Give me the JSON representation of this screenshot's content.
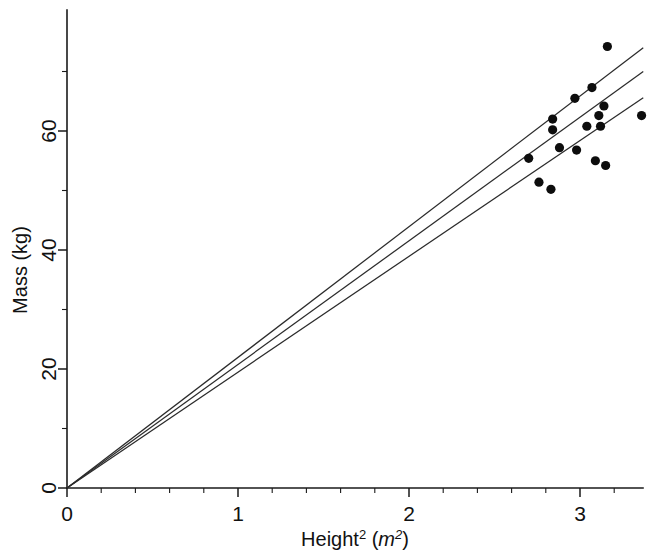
{
  "chart_data": {
    "type": "scatter",
    "title": "",
    "subtitle": "",
    "xlabel": "Height² (m²)",
    "xlabel_parts": {
      "base": "Height",
      "base_exponent": "2",
      "unit_open": " (",
      "unit": "m",
      "unit_exponent": "2",
      "unit_close": ")"
    },
    "ylabel": "Mass (kg)",
    "xlim": [
      0,
      3.37
    ],
    "ylim": [
      0,
      76
    ],
    "grid": false,
    "legend": null,
    "x_ticks_major": [
      0,
      1,
      2,
      3
    ],
    "x_tick_labels": [
      "0",
      "1",
      "2",
      "3"
    ],
    "x_ticks_minor": [
      0.2,
      0.4,
      0.6,
      0.8,
      1.2,
      1.4,
      1.6,
      1.8,
      2.2,
      2.4,
      2.6,
      2.8,
      3.2
    ],
    "y_ticks_major": [
      0,
      20,
      40,
      60
    ],
    "y_tick_labels": [
      "0",
      "20",
      "40",
      "60"
    ],
    "y_ticks_minor": [
      10,
      30,
      50,
      70
    ],
    "points": [
      {
        "x": 3.16,
        "y": 74.2
      },
      {
        "x": 3.07,
        "y": 67.3
      },
      {
        "x": 2.97,
        "y": 65.5
      },
      {
        "x": 3.14,
        "y": 64.2
      },
      {
        "x": 2.84,
        "y": 62.0
      },
      {
        "x": 2.84,
        "y": 60.2
      },
      {
        "x": 3.11,
        "y": 62.6
      },
      {
        "x": 3.04,
        "y": 60.8
      },
      {
        "x": 3.12,
        "y": 60.8
      },
      {
        "x": 3.36,
        "y": 62.6
      },
      {
        "x": 2.88,
        "y": 57.2
      },
      {
        "x": 2.98,
        "y": 56.8
      },
      {
        "x": 2.7,
        "y": 55.4
      },
      {
        "x": 3.09,
        "y": 55.0
      },
      {
        "x": 3.15,
        "y": 54.2
      },
      {
        "x": 2.76,
        "y": 51.4
      },
      {
        "x": 2.83,
        "y": 50.2
      }
    ],
    "lines": [
      {
        "name": "upper-band",
        "x0": 0,
        "y0": 0,
        "x1": 3.37,
        "y1": 74.0,
        "slope": 21.96
      },
      {
        "name": "fit-line",
        "x0": 0,
        "y0": 0,
        "x1": 3.37,
        "y1": 70.0,
        "slope": 20.77
      },
      {
        "name": "lower-band",
        "x0": 0,
        "y0": 0,
        "x1": 3.37,
        "y1": 65.6,
        "slope": 19.46
      }
    ]
  }
}
